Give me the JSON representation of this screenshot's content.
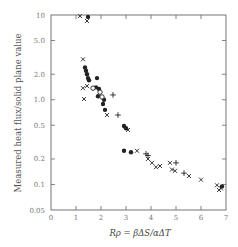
{
  "chart_data": {
    "type": "scatter",
    "title": "",
    "xlabel": "Rρ = βΔS/αΔT",
    "ylabel": "Measured heat flux/solid plane value",
    "xlim": [
      0,
      7
    ],
    "ylim": [
      0.05,
      10
    ],
    "yscale": "log",
    "grid": false,
    "legend": null,
    "x_ticks": [
      "0",
      "1",
      "2",
      "3",
      "4",
      "5",
      "6",
      "7"
    ],
    "y_ticks": [
      "10",
      "5.0",
      "2.0",
      "1.0",
      "0.5",
      "0.2",
      "0.1",
      "0.05"
    ],
    "y_tick_values": [
      10,
      5,
      2,
      1,
      0.5,
      0.2,
      0.1,
      0.05
    ],
    "series": [
      {
        "name": "cross",
        "marker": "x",
        "points": [
          [
            1.16,
            9.7
          ],
          [
            1.44,
            8.5
          ],
          [
            1.28,
            3.0
          ],
          [
            1.28,
            1.37
          ],
          [
            1.44,
            1.45
          ],
          [
            1.32,
            1.02
          ],
          [
            2.24,
            0.66
          ],
          [
            3.08,
            0.44
          ],
          [
            3.44,
            0.25
          ],
          [
            3.88,
            0.2
          ],
          [
            4.04,
            0.18
          ],
          [
            4.2,
            0.16
          ],
          [
            4.36,
            0.165
          ],
          [
            4.76,
            0.18
          ],
          [
            4.84,
            0.15
          ],
          [
            4.96,
            0.145
          ],
          [
            5.52,
            0.126
          ],
          [
            6.0,
            0.114
          ],
          [
            6.64,
            0.098
          ],
          [
            6.72,
            0.086
          ],
          [
            6.8,
            0.09
          ]
        ]
      },
      {
        "name": "filled-circle",
        "marker": "filled-circle",
        "points": [
          [
            1.48,
            9.5
          ],
          [
            1.36,
            2.4
          ],
          [
            1.4,
            2.2
          ],
          [
            1.44,
            2.0
          ],
          [
            1.48,
            1.8
          ],
          [
            1.52,
            1.7
          ],
          [
            1.84,
            1.8
          ],
          [
            1.8,
            1.4
          ],
          [
            1.92,
            1.34
          ],
          [
            1.88,
            1.1
          ],
          [
            2.12,
            1.0
          ],
          [
            2.08,
            0.89
          ],
          [
            2.16,
            0.76
          ],
          [
            2.92,
            0.49
          ],
          [
            3.0,
            0.46
          ],
          [
            2.92,
            0.25
          ],
          [
            3.2,
            0.24
          ],
          [
            6.84,
            0.095
          ]
        ]
      },
      {
        "name": "open-circle",
        "marker": "open-circle",
        "points": [
          [
            1.68,
            1.37
          ],
          [
            1.96,
            1.23
          ],
          [
            2.04,
            1.08
          ]
        ]
      },
      {
        "name": "plus",
        "marker": "plus",
        "points": [
          [
            2.48,
            1.14
          ],
          [
            2.68,
            0.66
          ],
          [
            3.8,
            0.23
          ],
          [
            3.88,
            0.22
          ],
          [
            5.0,
            0.18
          ],
          [
            5.32,
            0.136
          ]
        ]
      }
    ]
  },
  "colors": {
    "axis": "#666666",
    "marker": "#222222",
    "text": "#555555"
  }
}
